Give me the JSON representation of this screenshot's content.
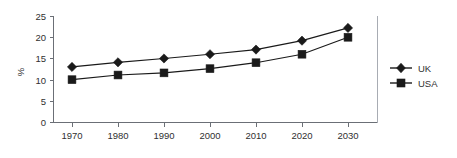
{
  "chart_data": {
    "type": "line",
    "title": "",
    "xlabel": "",
    "ylabel": "%",
    "categories": [
      "1970",
      "1980",
      "1990",
      "2000",
      "2010",
      "2020",
      "2030"
    ],
    "x": [
      1970,
      1980,
      1990,
      2000,
      2010,
      2020,
      2030
    ],
    "xlim": [
      1965,
      2035
    ],
    "ylim": [
      0,
      25
    ],
    "y_ticks": [
      "0",
      "5",
      "10",
      "15",
      "20",
      "25"
    ],
    "y_tick_values": [
      0,
      5,
      10,
      15,
      20,
      25
    ],
    "grid": false,
    "legend_position": "right",
    "series": [
      {
        "name": "UK",
        "marker": "diamond",
        "color": "#1a1a1a",
        "values": [
          13.1,
          14.2,
          15.1,
          16.1,
          17.2,
          19.3,
          22.3
        ]
      },
      {
        "name": "USA",
        "marker": "square",
        "color": "#1a1a1a",
        "values": [
          10.1,
          11.2,
          11.7,
          12.7,
          14.1,
          16.1,
          20.1
        ]
      }
    ]
  },
  "axes": {
    "y_axis_label": "%",
    "y_ticks": [
      "25",
      "20",
      "15",
      "10",
      "5",
      "0"
    ],
    "x_ticks": [
      "1970",
      "1980",
      "1990",
      "2000",
      "2010",
      "2020",
      "2030"
    ]
  },
  "legend": {
    "items": [
      {
        "label": "UK",
        "marker": "diamond-icon"
      },
      {
        "label": "USA",
        "marker": "square-icon"
      }
    ]
  }
}
